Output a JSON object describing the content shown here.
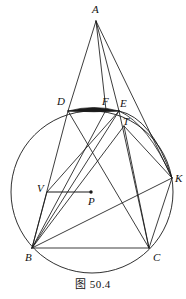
{
  "figure": {
    "caption": "图 50.4",
    "canvas": {
      "width": 186,
      "height": 299
    },
    "stroke_color": "#1a1a1a",
    "fill_color": "#1a1a1a",
    "background": "#ffffff"
  },
  "points": {
    "A": {
      "label": "A",
      "x": 96,
      "y": 21,
      "label_x": 92,
      "label_y": 4
    },
    "B": {
      "label": "B",
      "x": 32,
      "y": 248,
      "label_x": 25,
      "label_y": 251
    },
    "C": {
      "label": "C",
      "x": 149,
      "y": 248,
      "label_x": 153,
      "label_y": 251
    },
    "D": {
      "label": "D",
      "x": 68,
      "y": 111,
      "label_x": 57,
      "label_y": 96
    },
    "E": {
      "label": "E",
      "x": 119,
      "y": 111,
      "label_x": 119,
      "label_y": 98
    },
    "F": {
      "label": "F",
      "x": 106,
      "y": 110,
      "label_x": 102,
      "label_y": 96
    },
    "T": {
      "label": "T",
      "x": 124,
      "y": 126,
      "label_x": 122,
      "label_y": 116
    },
    "K": {
      "label": "K",
      "x": 172,
      "y": 178,
      "label_x": 174,
      "label_y": 173
    },
    "V": {
      "label": "V",
      "x": 47,
      "y": 192,
      "label_x": 37,
      "label_y": 183
    },
    "P": {
      "label": "P",
      "x": 91,
      "y": 192,
      "label_x": 87,
      "label_y": 195
    },
    "X": {
      "label": "",
      "x": 95,
      "y": 152,
      "label_x": 0,
      "label_y": 0
    }
  },
  "circumcircle": {
    "cx": 92,
    "cy": 192,
    "r": 81
  },
  "second_arc": {
    "description": "arc through E, T and K",
    "from": "E",
    "through": "T",
    "to": "K"
  },
  "segment_shading": {
    "description": "shaded thin circular segment between D and E along chord DE"
  },
  "segments": [
    {
      "name": "A-D",
      "from": "A",
      "to": "D"
    },
    {
      "name": "A-F",
      "from": "A",
      "to": "F"
    },
    {
      "name": "A-E",
      "from": "A",
      "to": "E"
    },
    {
      "name": "A-K",
      "from": "A",
      "to": "K"
    },
    {
      "name": "D-E",
      "from": "D",
      "to": "E"
    },
    {
      "name": "D-B",
      "from": "D",
      "to": "B"
    },
    {
      "name": "D-C",
      "from": "D",
      "to": "C"
    },
    {
      "name": "E-B",
      "from": "E",
      "to": "B"
    },
    {
      "name": "E-C",
      "from": "E",
      "to": "C"
    },
    {
      "name": "F-B",
      "from": "F",
      "to": "B"
    },
    {
      "name": "T-B",
      "from": "T",
      "to": "B"
    },
    {
      "name": "T-C",
      "from": "T",
      "to": "C"
    },
    {
      "name": "T-K",
      "from": "T",
      "to": "K"
    },
    {
      "name": "B-C",
      "from": "B",
      "to": "C"
    },
    {
      "name": "B-K",
      "from": "B",
      "to": "K"
    },
    {
      "name": "C-K",
      "from": "C",
      "to": "K"
    },
    {
      "name": "V-P",
      "from": "V",
      "to": "P"
    },
    {
      "name": "V-E",
      "from": "V",
      "to": "E"
    },
    {
      "name": "V-B",
      "from": "V",
      "to": "B"
    }
  ]
}
